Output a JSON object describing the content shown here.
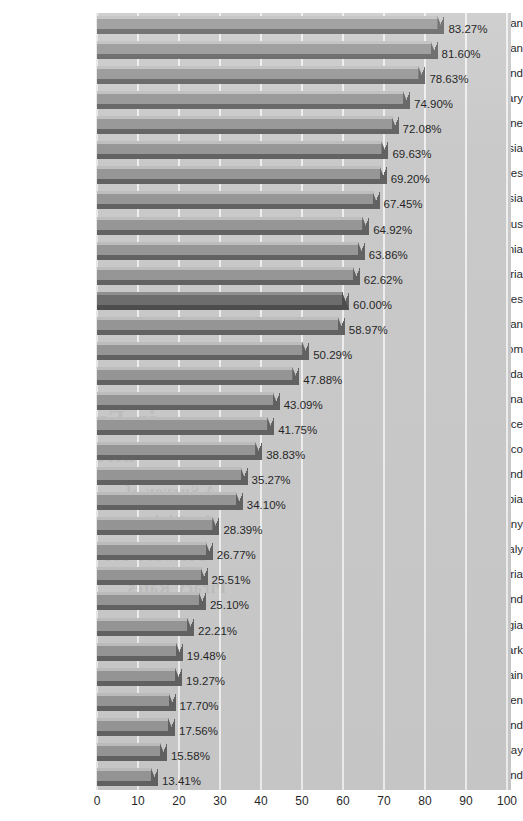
{
  "chart_data": {
    "type": "bar",
    "orientation": "horizontal",
    "title": "",
    "subtitle": "",
    "xlabel": "",
    "ylabel": "",
    "xlim": [
      0,
      100
    ],
    "value_suffix": "%",
    "grid": true,
    "grid_axis": "x",
    "legend": "none",
    "highlight_category": "United States",
    "x_ticks": [
      "0",
      "10",
      "20",
      "30",
      "40",
      "50",
      "60",
      "70",
      "80",
      "90",
      "100"
    ],
    "x_tick_values": [
      0,
      10,
      20,
      30,
      40,
      50,
      60,
      70,
      80,
      90,
      100
    ],
    "categories": [
      "Taiwan",
      "Pakistan",
      "Thailand",
      "Hungary",
      "Ukraine",
      "Malaysia",
      "Philippines",
      "Russia",
      "Belarus",
      "Estonia",
      "Nigeria",
      "United States",
      "Japan",
      "United Kingdom",
      "Canada",
      "Argentina",
      "France",
      "Mexico",
      "Finland",
      "Colombia",
      "Germany",
      "Italy",
      "Austria",
      "Switzerland",
      "Georgia",
      "Denmark",
      "Spain",
      "Sweden",
      "Ireland",
      "Norway",
      "Iceland"
    ],
    "values": [
      83.27,
      81.6,
      78.63,
      74.9,
      72.08,
      69.63,
      69.2,
      67.45,
      64.92,
      63.86,
      62.62,
      60.0,
      58.97,
      50.29,
      47.88,
      43.09,
      41.75,
      38.83,
      35.27,
      34.1,
      28.39,
      26.77,
      25.51,
      25.1,
      22.21,
      19.48,
      19.27,
      17.7,
      17.56,
      15.58,
      13.41
    ],
    "value_labels": [
      "83.27%",
      "81.60%",
      "78.63%",
      "74.90%",
      "72.08%",
      "69.63%",
      "69.20%",
      "67.45%",
      "64.92%",
      "63.86%",
      "62.62%",
      "60.00%",
      "58.97%",
      "50.29%",
      "47.88%",
      "43.09%",
      "41.75%",
      "38.83%",
      "35.27%",
      "34.10%",
      "28.39%",
      "26.77%",
      "25.51%",
      "25.10%",
      "22.21%",
      "19.48%",
      "19.27%",
      "17.70%",
      "17.56%",
      "15.58%",
      "13.41%"
    ]
  },
  "style": {
    "plot_background": "#c8c8c8",
    "page_background": "#ffffff",
    "bar_fill": "#949494",
    "bar_top_edge": "#bdbdbd",
    "bar_shadow": "#5f5f5f",
    "bar_highlight_fill": "#6b6b6b",
    "bar_highlight_shadow": "#4a4a4a",
    "gridline_color": "#eeeeee",
    "text_color": "#1f1f1f"
  },
  "ghost_text": [
    "in Europe",
    "and Consumer",
    "A Survey of",
    "the Global",
    "Software Use",
    "Piracy Rates"
  ]
}
